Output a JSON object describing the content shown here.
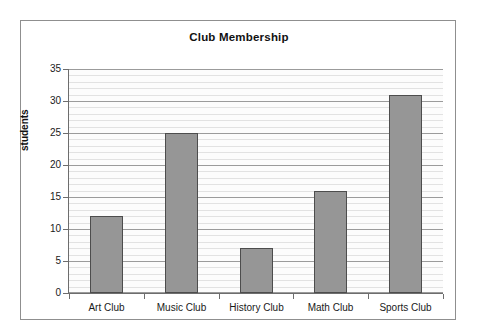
{
  "chart_data": {
    "type": "bar",
    "title": "Club Membership",
    "xlabel": "",
    "ylabel": "students",
    "categories": [
      "Art Club",
      "Music Club",
      "History Club",
      "Math Club",
      "Sports Club"
    ],
    "values": [
      12,
      25,
      7,
      16,
      31
    ],
    "ylim": [
      0,
      35
    ],
    "y_ticks": [
      0,
      5,
      10,
      15,
      20,
      25,
      30,
      35
    ],
    "y_tick_labels": [
      "0",
      "5",
      "10",
      "15",
      "20",
      "25",
      "30",
      "35"
    ],
    "grid": "horizontal major and minor",
    "minor_tick_step": 1,
    "major_tick_step": 5,
    "legend": null,
    "series": [
      {
        "name": "students",
        "values": [
          12,
          25,
          7,
          16,
          31
        ]
      }
    ],
    "colors": {
      "bar_fill": "#969696",
      "bar_border": "#4d4d4d",
      "major_gridline": "#9b9b9b",
      "minor_gridline": "#e2e2e2",
      "axis": "#6d6d6d",
      "plot_background": "#fcfcfc",
      "figure_background": "#ffffff",
      "frame_border": "#8f8f8f",
      "text": "#111111"
    }
  }
}
